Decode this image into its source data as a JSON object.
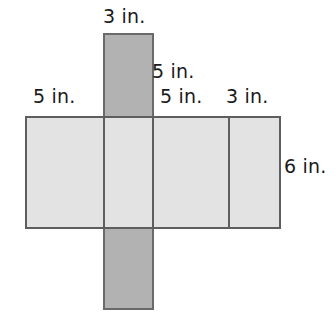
{
  "figure": {
    "unit": "in.",
    "colors": {
      "background": "#ffffff",
      "main_face_fill": "#e3e3e3",
      "strip_face_fill": "#b2b2b2",
      "outline": "#5e5e5e",
      "strip_outline": "#6a6a6a",
      "label_text": "#1a1a1a"
    }
  },
  "labels": {
    "top_strip_width": "3 in.",
    "left_face_width": "5 in.",
    "upper_middle_width": "5 in.",
    "inner_face_width": "5 in.",
    "right_face_width": "3 in.",
    "main_height": "6 in."
  },
  "chart_data": {
    "type": "diagram",
    "unit": "in.",
    "shapes": [
      {
        "name": "vertical-strip",
        "role": "top-and-bottom-faces-strip",
        "fill": "#b2b2b2",
        "x": 103,
        "y": 33,
        "width": 51,
        "height": 277,
        "labeled_width": "3 in."
      },
      {
        "name": "main-rectangle",
        "role": "side-faces-band",
        "fill": "#e3e3e3",
        "x": 25,
        "y": 116,
        "width": 256,
        "height": 113,
        "labeled_height": "6 in."
      }
    ],
    "fold_lines_x": [
      103,
      152,
      228
    ],
    "segment_widths": [
      "5 in.",
      "3 in.",
      "5 in.",
      "3 in."
    ],
    "prism_dimensions": {
      "length": "5 in.",
      "width": "3 in.",
      "height": "6 in."
    }
  }
}
